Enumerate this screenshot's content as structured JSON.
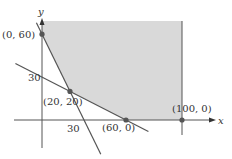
{
  "diagram": {
    "type": "feasible-region",
    "axes": {
      "x_label": "x",
      "y_label": "y"
    },
    "region": {
      "fill": "#d9d9d9",
      "x_max": 100,
      "y_max": 70,
      "description": "unbounded-up region bounded by x=100"
    },
    "lines": [
      {
        "name": "line-steep",
        "x_intercept": 30,
        "y_intercept": 60
      },
      {
        "name": "line-shallow",
        "x_intercept": 60,
        "y_intercept": 30
      }
    ],
    "vertices": [
      {
        "label": "(0, 60)",
        "x": 0,
        "y": 60
      },
      {
        "label": "(20, 20)",
        "x": 20,
        "y": 20
      },
      {
        "label": "(60, 0)",
        "x": 60,
        "y": 0
      },
      {
        "label": "(100, 0)",
        "x": 100,
        "y": 0
      }
    ],
    "tick_labels": [
      {
        "text": "30",
        "axis": "y",
        "value": 30
      },
      {
        "text": "30",
        "axis": "x",
        "value": 30
      }
    ]
  }
}
